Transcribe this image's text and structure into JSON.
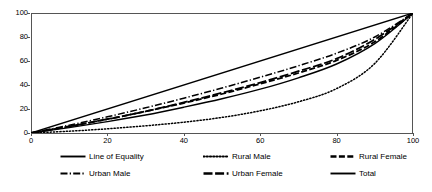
{
  "chart_data": {
    "type": "line",
    "title": "",
    "subtitle": "",
    "xlabel": "",
    "ylabel": "",
    "xlim": [
      0,
      100
    ],
    "ylim": [
      0,
      100
    ],
    "grid": false,
    "legend_position": "bottom",
    "x_ticks": [
      0,
      20,
      40,
      60,
      80,
      100
    ],
    "y_ticks": [
      0,
      20,
      40,
      60,
      80,
      100
    ],
    "x": [
      0,
      10,
      20,
      30,
      40,
      50,
      60,
      70,
      80,
      90,
      100
    ],
    "series": [
      {
        "name": "Line of Equality",
        "style": "solid",
        "values": [
          0,
          10,
          20,
          30,
          40,
          50,
          60,
          70,
          80,
          90,
          100
        ]
      },
      {
        "name": "Rural Male",
        "style": "dotted",
        "values": [
          0,
          1.5,
          3.5,
          6,
          9,
          13,
          18.5,
          26,
          37,
          58,
          100
        ]
      },
      {
        "name": "Rural Female",
        "style": "dashed",
        "values": [
          0,
          5.5,
          11.5,
          18,
          25,
          32.5,
          41,
          50,
          60.5,
          76,
          100
        ]
      },
      {
        "name": "Urban Male",
        "style": "dash-dot",
        "values": [
          0,
          6.5,
          13.5,
          21,
          29,
          37.5,
          46.5,
          56,
          66.5,
          80,
          100
        ]
      },
      {
        "name": "Urban Female",
        "style": "long-dash",
        "values": [
          0,
          5.5,
          11.5,
          18,
          25.5,
          33.5,
          42,
          51.5,
          62,
          78,
          100
        ]
      },
      {
        "name": "Total",
        "style": "solid",
        "values": [
          0,
          4.5,
          9.5,
          15,
          21.5,
          28.5,
          36.5,
          46,
          57.5,
          74.5,
          100
        ]
      }
    ]
  },
  "legend": {
    "rows": [
      [
        {
          "label": "Line of Equality",
          "style": "solid"
        },
        {
          "label": "Rural Male",
          "style": "dotted"
        },
        {
          "label": "Rural Female",
          "style": "dashed"
        }
      ],
      [
        {
          "label": "Urban Male",
          "style": "dash-dot"
        },
        {
          "label": "Urban Female",
          "style": "long-dash"
        },
        {
          "label": "Total",
          "style": "solid"
        }
      ]
    ]
  },
  "colors": {
    "line": "#000000",
    "axis": "#555555",
    "background": "#ffffff"
  }
}
